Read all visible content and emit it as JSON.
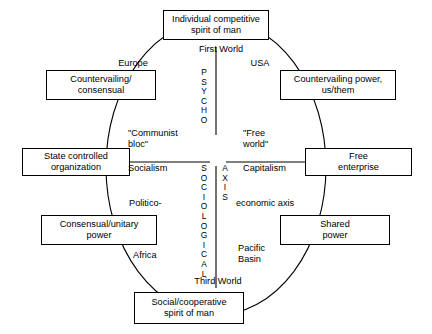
{
  "diagram": {
    "boxes": {
      "top": {
        "lines": [
          "Individual competitive",
          "spirit of man"
        ]
      },
      "top_left": {
        "lines": [
          "Countervailing/",
          "consensual"
        ]
      },
      "top_right": {
        "lines": [
          "Countervailing power,",
          "us/them"
        ]
      },
      "left": {
        "lines": [
          "State controlled",
          "organization"
        ]
      },
      "right": {
        "lines": [
          "Free",
          "enterprise"
        ]
      },
      "bottom_left": {
        "lines": [
          "Consensual/unitary",
          "power"
        ]
      },
      "bottom_right": {
        "lines": [
          "Shared",
          "power"
        ]
      },
      "bottom": {
        "lines": [
          "Social/cooperative",
          "spirit of man"
        ]
      }
    },
    "ring_labels": {
      "first_world": "First  World",
      "europe": "Europe",
      "usa": "USA",
      "communist_bloc": [
        "\"Communist",
        "bloc\""
      ],
      "free_world": [
        "\"Free",
        "world\""
      ],
      "socialism": "Socialism",
      "capitalism": "Capitalism",
      "politico": "Politico-",
      "economic_axis": "economic axis",
      "africa": "Africa",
      "pacific_basin": [
        "Pacific",
        "Basin"
      ],
      "third_world": "Third World"
    },
    "axis_labels": {
      "vertical_upper": [
        "P",
        "S",
        "Y",
        "C",
        "H",
        "O"
      ],
      "vertical_lower": [
        "S",
        "O",
        "C",
        "I",
        "O",
        "L",
        "O",
        "G",
        "I",
        "C",
        "A",
        "L"
      ],
      "horizontal_word": [
        "A",
        "X",
        "I",
        "S"
      ]
    },
    "colors": {
      "stroke": "#000000",
      "background": "#ffffff",
      "text": "#000000"
    }
  }
}
